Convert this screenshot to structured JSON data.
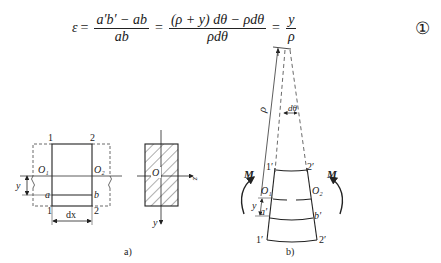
{
  "equation": {
    "lhs": "ε",
    "eq1": "=",
    "frac1": {
      "num": "a′b′ − ab",
      "den": "ab"
    },
    "eq2": "=",
    "frac2": {
      "num": "(ρ + y) dθ − ρdθ",
      "den": "ρdθ"
    },
    "eq3": "=",
    "frac3": {
      "num": "y",
      "den": "ρ"
    },
    "number": "①"
  },
  "figure_a": {
    "caption": "a)",
    "labels": {
      "top_left": "1",
      "top_right": "2",
      "bottom_left": "1",
      "bottom_right": "2",
      "O1": "O₁",
      "O2": "O₂",
      "a": "a",
      "b": "b",
      "y": "y",
      "dx": "dx"
    },
    "cross_section": {
      "origin": "O",
      "z_axis": "z",
      "y_axis": "y"
    }
  },
  "figure_b": {
    "caption": "b)",
    "labels": {
      "rho": "ρ",
      "dtheta": "dθ",
      "top_left": "1′",
      "top_right": "2′",
      "bottom_left": "1′",
      "bottom_right": "2′",
      "O1": "O₁",
      "O2": "O₂",
      "a": "a′",
      "b": "b′",
      "y": "y",
      "moment_left": "M",
      "moment_right": "M"
    }
  },
  "colors": {
    "line": "#222222",
    "background": "#ffffff"
  }
}
